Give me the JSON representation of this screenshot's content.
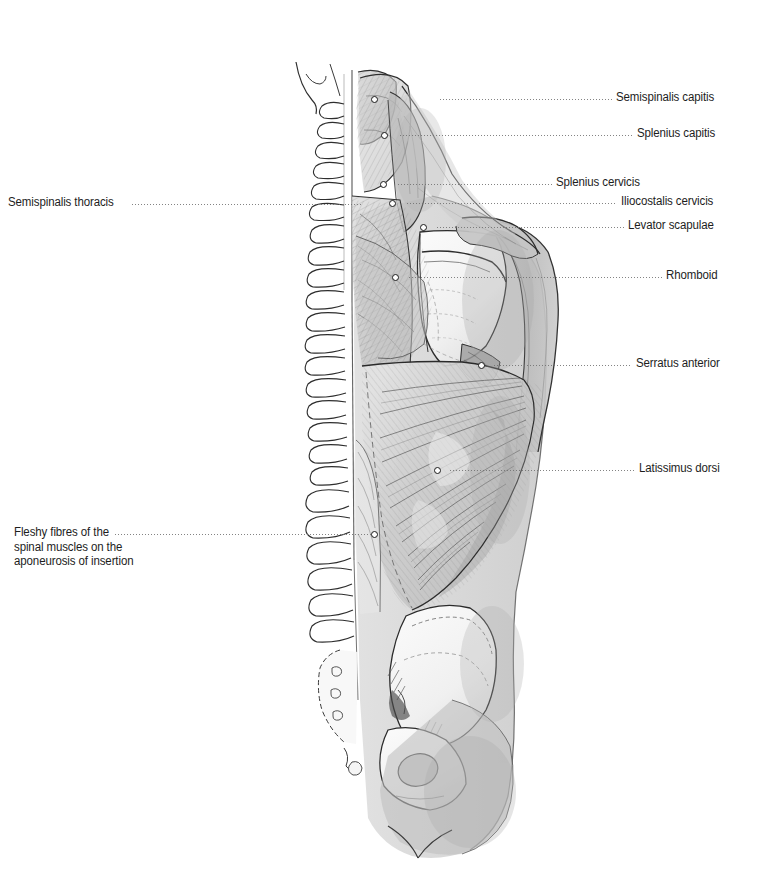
{
  "figure": {
    "background_color": "#ffffff",
    "ink_color": "#1a1a1a",
    "label_color": "#1d1d1d",
    "leader_color": "#6e6e6e",
    "width": 760,
    "height": 888
  },
  "labels_right": [
    {
      "id": "semispinalis-capitis",
      "text": "Semispinalis capitis",
      "text_x": 616,
      "text_y": 90,
      "leader_x": 440,
      "leader_y": 99,
      "leader_w": 172,
      "dot_x": 374,
      "dot_y": 99
    },
    {
      "id": "splenius-capitis",
      "text": "Splenius capitis",
      "text_x": 637,
      "text_y": 126,
      "leader_x": 400,
      "leader_y": 135,
      "leader_w": 233,
      "dot_x": 384,
      "dot_y": 135
    },
    {
      "id": "splenius-cervicis",
      "text": "Splenius cervicis",
      "text_x": 556,
      "text_y": 175,
      "leader_x": 398,
      "leader_y": 184,
      "leader_w": 154,
      "dot_x": 383,
      "dot_y": 184
    },
    {
      "id": "iliocostalis-cervicis",
      "text": "Iliocostalis cervicis",
      "text_x": 621,
      "text_y": 194,
      "leader_x": 407,
      "leader_y": 203,
      "leader_w": 210,
      "dot_x": 392,
      "dot_y": 203
    },
    {
      "id": "levator-scapulae",
      "text": "Levator scapulae",
      "text_x": 628,
      "text_y": 218,
      "leader_x": 437,
      "leader_y": 227,
      "leader_w": 187,
      "dot_x": 423,
      "dot_y": 227
    },
    {
      "id": "rhomboid",
      "text": "Rhomboid",
      "text_x": 666,
      "text_y": 268,
      "leader_x": 409,
      "leader_y": 277,
      "leader_w": 253,
      "dot_x": 395,
      "dot_y": 277
    },
    {
      "id": "serratus-anterior",
      "text": "Serratus anterior",
      "text_x": 636,
      "text_y": 356,
      "leader_x": 494,
      "leader_y": 365,
      "leader_w": 138,
      "dot_x": 481,
      "dot_y": 365
    },
    {
      "id": "latissimus-dorsi",
      "text": "Latissimus dorsi",
      "text_x": 639,
      "text_y": 461,
      "leader_x": 450,
      "leader_y": 470,
      "leader_w": 185,
      "dot_x": 437,
      "dot_y": 470
    }
  ],
  "labels_left": [
    {
      "id": "semispinalis-thoracis",
      "text": "Semispinalis thoracis",
      "text_x": 8,
      "text_y": 195,
      "leader_x": 132,
      "leader_y": 204,
      "leader_w": 229,
      "dot_x": null,
      "dot_y": null
    },
    {
      "id": "fleshy-fibres",
      "text": "Fleshy fibres of the\nspinal muscles on the\naponeurosis of insertion",
      "text_x": 14,
      "text_y": 525,
      "leader_x": 115,
      "leader_y": 534,
      "leader_w": 260,
      "dot_x": 374,
      "dot_y": 534
    }
  ],
  "anatomy_parts": [
    "occipital-bone",
    "cervical-vertebrae",
    "thoracic-vertebrae",
    "lumbar-vertebrae",
    "sacrum",
    "scapula",
    "clavicle-acromion",
    "humerus-arm",
    "ilium",
    "ischium",
    "obturator-foramen",
    "semispinalis-capitis-muscle",
    "splenius-capitis-muscle",
    "splenius-cervicis-muscle",
    "iliocostalis-cervicis-muscle",
    "levator-scapulae-muscle",
    "rhomboid-muscle",
    "serratus-anterior-muscle",
    "latissimus-dorsi-muscle",
    "erector-spinae-muscle",
    "gluteal-region",
    "body-silhouette"
  ]
}
